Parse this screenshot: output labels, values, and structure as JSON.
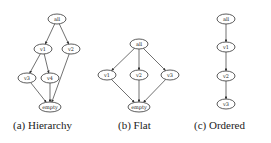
{
  "figure": {
    "panels": [
      {
        "id": "hierarchy",
        "caption": "(a) Hierarchy",
        "nodes": [
          {
            "id": "all",
            "label": "all",
            "x": 57,
            "y": 19
          },
          {
            "id": "v1",
            "label": "v1",
            "x": 43,
            "y": 49
          },
          {
            "id": "v2",
            "label": "v2",
            "x": 71,
            "y": 49
          },
          {
            "id": "v3",
            "label": "v3",
            "x": 27,
            "y": 78
          },
          {
            "id": "v4",
            "label": "v4",
            "x": 50,
            "y": 78
          },
          {
            "id": "empty",
            "label": "empty",
            "x": 50,
            "y": 107
          }
        ],
        "edges": [
          [
            "all",
            "v1"
          ],
          [
            "all",
            "v2"
          ],
          [
            "v1",
            "v3"
          ],
          [
            "v1",
            "v4"
          ],
          [
            "v3",
            "empty"
          ],
          [
            "v4",
            "empty"
          ],
          [
            "v2",
            "empty"
          ]
        ]
      },
      {
        "id": "flat",
        "caption": "(b) Flat",
        "nodes": [
          {
            "id": "all",
            "label": "all",
            "x": 139,
            "y": 44
          },
          {
            "id": "v1",
            "label": "v1",
            "x": 107,
            "y": 75
          },
          {
            "id": "v2",
            "label": "v2",
            "x": 139,
            "y": 75
          },
          {
            "id": "v3",
            "label": "v3",
            "x": 170,
            "y": 75
          },
          {
            "id": "empty",
            "label": "empty",
            "x": 139,
            "y": 107
          }
        ],
        "edges": [
          [
            "all",
            "v1"
          ],
          [
            "all",
            "v2"
          ],
          [
            "all",
            "v3"
          ],
          [
            "v1",
            "empty"
          ],
          [
            "v2",
            "empty"
          ],
          [
            "v3",
            "empty"
          ]
        ]
      },
      {
        "id": "ordered",
        "caption": "(c) Ordered",
        "nodes": [
          {
            "id": "all",
            "label": "all",
            "x": 226,
            "y": 19
          },
          {
            "id": "v1",
            "label": "v1",
            "x": 226,
            "y": 47
          },
          {
            "id": "v2",
            "label": "v2",
            "x": 226,
            "y": 76
          },
          {
            "id": "v3",
            "label": "v3",
            "x": 226,
            "y": 104
          }
        ],
        "edges": [
          [
            "all",
            "v1"
          ],
          [
            "v1",
            "v2"
          ],
          [
            "v2",
            "v3"
          ]
        ]
      }
    ]
  },
  "captions": {
    "a": "(a) Hierarchy",
    "b": "(b) Flat",
    "c": "(c) Ordered"
  }
}
